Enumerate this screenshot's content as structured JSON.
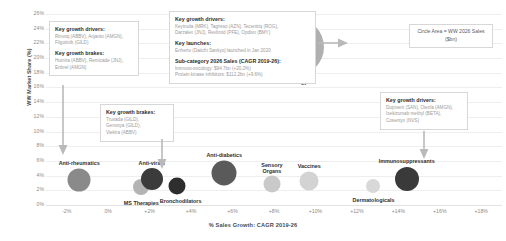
{
  "chart_data": {
    "type": "scatter",
    "title": "",
    "xlabel": "% Sales Growth: CAGR 2019-26",
    "ylabel": "WW Market Share (%)",
    "xlim": [
      -3,
      19
    ],
    "ylim": [
      0,
      26
    ],
    "grid": true,
    "legend": "Circle Area = WW 2026 Sales ($bn)",
    "size_encoding": "Circle Area = WW 2026 Sales ($bn)",
    "xticks": [
      "-2%",
      "0%",
      "+2%",
      "+4%",
      "+6%",
      "+8%",
      "+10%",
      "+12%",
      "+14%",
      "+16%",
      "+18%"
    ],
    "yticks": [
      "0%",
      "2%",
      "4%",
      "6%",
      "8%",
      "10%",
      "12%",
      "14%",
      "16%",
      "18%",
      "20%",
      "22%",
      "24%",
      "26%"
    ],
    "points": [
      {
        "label": "Anti-rheumatics",
        "x": -1.4,
        "y": 3.4,
        "r": 11.5,
        "color": "#8a8a8a"
      },
      {
        "label": "MS Therapies",
        "x": 1.6,
        "y": 2.4,
        "r": 8.0,
        "color": "#b4b4b4"
      },
      {
        "label": "Anti-virals",
        "x": 2.1,
        "y": 3.6,
        "r": 11.0,
        "color": "#3b3b3b"
      },
      {
        "label": "Bronchodilators",
        "x": 3.3,
        "y": 2.6,
        "r": 8.5,
        "color": "#2e2e2e"
      },
      {
        "label": "Anti-diabetics",
        "x": 5.6,
        "y": 4.4,
        "r": 12.5,
        "color": "#5a5a5a"
      },
      {
        "label": "Sensory Organs",
        "x": 7.9,
        "y": 2.9,
        "r": 8.5,
        "color": "#c9c9c9"
      },
      {
        "label": "Vaccines",
        "x": 9.7,
        "y": 3.3,
        "r": 9.5,
        "color": "#d3d3d3"
      },
      {
        "label": "Dermatologicals",
        "x": 12.8,
        "y": 2.6,
        "r": 7.0,
        "color": "#d8d8d8"
      },
      {
        "label": "Immunosuppressants",
        "x": 14.4,
        "y": 3.5,
        "r": 12.0,
        "color": "#3a3a3a"
      },
      {
        "label": "Oncology",
        "x": 9.0,
        "y": 21.5,
        "r": 29.0,
        "color": "#b0b0b0"
      }
    ]
  },
  "annotations": {
    "box_left_top": {
      "drivers_heading": "Key growth drivers:",
      "drivers_body": "Rinvoq (ABBV), Anjanto (AMGN),\nFilgotinib (GILD)",
      "brakes_heading": "Key growth brakes:",
      "brakes_body": "Humira (ABBV), Remicade (JNJ),\nEnbrel (AMGN)"
    },
    "box_left_lower": {
      "brakes_heading": "Key growth brakes:",
      "brakes_body": "Truvada (GILD),\nGenvoya (GILD),\nViekira (ABBV)"
    },
    "box_center": {
      "drivers_heading": "Key growth drivers:",
      "drivers_body": "Keytruda (MRK), Tagrisso (AZN), Tecentriq (ROG),\nDarzalex (JNJ), Revlimid (PFE), Opdivo (BMY)",
      "launches_heading": "Key launches:",
      "launches_body": "Enhertu (Daiichi Sankyo) launched in Jan 2020",
      "subcat_heading": "Sub-category 2026 Sales (CAGR 2019-26):",
      "subcat_body": "Immuno-oncology: $94.7bn (+20.2%)\nProtein kinase inhibitors: $112.2bn (+9.6%)"
    },
    "box_right": {
      "drivers_heading": "Key growth drivers:",
      "drivers_body": "Dupixent (SAN), Otezla (AMGN),\nIxekizumab methyl (BETA),\nCosentyx (NVS)"
    }
  }
}
